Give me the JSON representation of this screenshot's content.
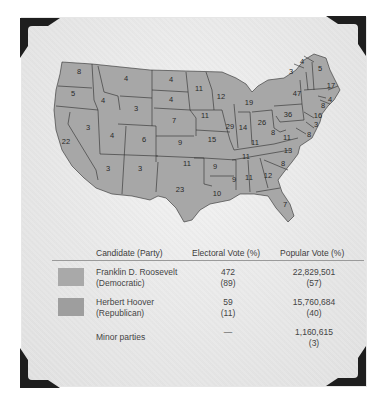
{
  "map": {
    "title": "1932 Presidential Election",
    "fill_color": "#a7a7a7",
    "border_color": "#2b2b2b",
    "state_labels": [
      {
        "state": "WA",
        "ev": "8",
        "x": 79,
        "y": 74
      },
      {
        "state": "OR",
        "ev": "5",
        "x": 73,
        "y": 96
      },
      {
        "state": "CA",
        "ev": "22",
        "x": 66,
        "y": 144
      },
      {
        "state": "ID",
        "ev": "4",
        "x": 103,
        "y": 103
      },
      {
        "state": "NV",
        "ev": "3",
        "x": 88,
        "y": 130
      },
      {
        "state": "MT",
        "ev": "4",
        "x": 126,
        "y": 81
      },
      {
        "state": "WY",
        "ev": "3",
        "x": 136,
        "y": 111
      },
      {
        "state": "UT",
        "ev": "4",
        "x": 112,
        "y": 138
      },
      {
        "state": "CO",
        "ev": "6",
        "x": 144,
        "y": 142
      },
      {
        "state": "AZ",
        "ev": "3",
        "x": 108,
        "y": 171
      },
      {
        "state": "NM",
        "ev": "3",
        "x": 140,
        "y": 171
      },
      {
        "state": "ND",
        "ev": "4",
        "x": 171,
        "y": 82
      },
      {
        "state": "SD",
        "ev": "4",
        "x": 171,
        "y": 102
      },
      {
        "state": "NE",
        "ev": "7",
        "x": 174,
        "y": 123
      },
      {
        "state": "KS",
        "ev": "9",
        "x": 180,
        "y": 145
      },
      {
        "state": "OK",
        "ev": "11",
        "x": 187,
        "y": 166
      },
      {
        "state": "TX",
        "ev": "23",
        "x": 180,
        "y": 192
      },
      {
        "state": "MN",
        "ev": "11",
        "x": 199,
        "y": 91
      },
      {
        "state": "IA",
        "ev": "11",
        "x": 205,
        "y": 118
      },
      {
        "state": "MO",
        "ev": "15",
        "x": 212,
        "y": 142
      },
      {
        "state": "AR",
        "ev": "9",
        "x": 215,
        "y": 169
      },
      {
        "state": "LA",
        "ev": "10",
        "x": 217,
        "y": 196
      },
      {
        "state": "WI",
        "ev": "12",
        "x": 221,
        "y": 99
      },
      {
        "state": "IL",
        "ev": "29",
        "x": 230,
        "y": 129
      },
      {
        "state": "MI",
        "ev": "19",
        "x": 249,
        "y": 105
      },
      {
        "state": "IN",
        "ev": "14",
        "x": 243,
        "y": 130
      },
      {
        "state": "OH",
        "ev": "26",
        "x": 262,
        "y": 125
      },
      {
        "state": "KY",
        "ev": "11",
        "x": 255,
        "y": 145
      },
      {
        "state": "TN",
        "ev": "11",
        "x": 246,
        "y": 159
      },
      {
        "state": "MS",
        "ev": "9",
        "x": 234,
        "y": 182
      },
      {
        "state": "AL",
        "ev": "11",
        "x": 249,
        "y": 180
      },
      {
        "state": "GA",
        "ev": "12",
        "x": 268,
        "y": 178
      },
      {
        "state": "FL",
        "ev": "7",
        "x": 285,
        "y": 207
      },
      {
        "state": "SC",
        "ev": "8",
        "x": 283,
        "y": 166
      },
      {
        "state": "NC",
        "ev": "13",
        "x": 288,
        "y": 153
      },
      {
        "state": "VA",
        "ev": "11",
        "x": 287,
        "y": 140
      },
      {
        "state": "WV",
        "ev": "8",
        "x": 273,
        "y": 135
      },
      {
        "state": "PA",
        "ev": "36",
        "x": 288,
        "y": 117
      },
      {
        "state": "NY",
        "ev": "47",
        "x": 297,
        "y": 96
      },
      {
        "state": "VT",
        "ev": "3",
        "x": 291,
        "y": 74
      },
      {
        "state": "NH",
        "ev": "4",
        "x": 302,
        "y": 64
      },
      {
        "state": "ME",
        "ev": "5",
        "x": 320,
        "y": 71
      },
      {
        "state": "MA",
        "ev": "17",
        "x": 331,
        "y": 88
      },
      {
        "state": "RI",
        "ev": "4",
        "x": 330,
        "y": 102
      },
      {
        "state": "CT",
        "ev": "8",
        "x": 323,
        "y": 108
      },
      {
        "state": "NJ",
        "ev": "16",
        "x": 318,
        "y": 118
      },
      {
        "state": "DE",
        "ev": "3",
        "x": 316,
        "y": 127
      },
      {
        "state": "MD",
        "ev": "8",
        "x": 309,
        "y": 137
      }
    ]
  },
  "table": {
    "headers": [
      "Candidate (Party)",
      "Electoral Vote (%)",
      "Popular Vote (%)"
    ],
    "rows": [
      {
        "name": "Franklin D. Roosevelt",
        "party": "(Democratic)",
        "ev": "472",
        "ev_pct": "(89)",
        "pv": "22,829,501",
        "pv_pct": "(57)",
        "swatch": "#a9a9a9"
      },
      {
        "name": "Herbert Hoover",
        "party": "(Republican)",
        "ev": "59",
        "ev_pct": "(11)",
        "pv": "15,760,684",
        "pv_pct": "(40)",
        "swatch": "#9e9e9e"
      },
      {
        "name": "Minor parties",
        "party": "",
        "ev": "—",
        "ev_pct": "",
        "pv": "1,160,615",
        "pv_pct": "(3)"
      }
    ]
  }
}
